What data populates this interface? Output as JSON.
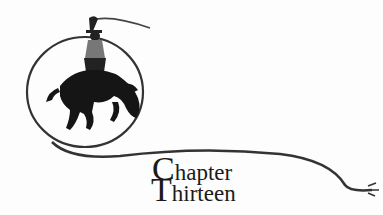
{
  "heading": {
    "line1_initial": "C",
    "line1_rest": "hapter",
    "line2_initial": "T",
    "line2_rest": "hirteen"
  },
  "illustration": {
    "subject": "bucking-bronco-rider-icon",
    "elements": [
      "cowboy",
      "bucking horse",
      "lasso loop",
      "rope"
    ]
  },
  "colors": {
    "ink": "#1a1a1a",
    "background": "#fdfdfd"
  }
}
